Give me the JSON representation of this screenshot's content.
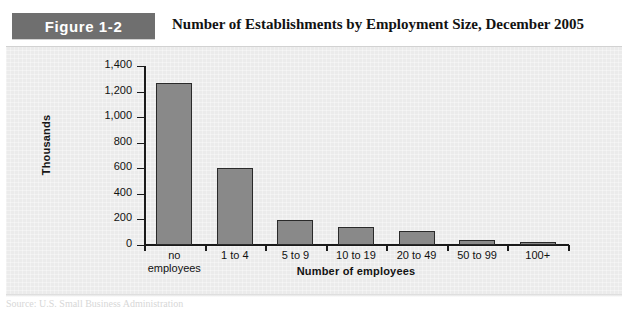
{
  "header": {
    "badge_label": "Figure 1-2",
    "title": "Number of Establishments by Employment Size, December 2005",
    "badge_color": "#6f6f6f",
    "title_color": "#121212"
  },
  "panel": {
    "background_color": "#ebebeb"
  },
  "footer": {
    "source_text": "Source: U.S. Small Business Administration"
  },
  "chart_data": {
    "type": "bar",
    "title": "Number of Establishments by Employment Size, December 2005",
    "xlabel": "Number of employees",
    "ylabel": "Thousands",
    "categories": [
      "no\nemployees",
      "1 to 4",
      "5 to 9",
      "10 to 19",
      "20 to 49",
      "50 to 99",
      "100+"
    ],
    "values": [
      1270,
      605,
      195,
      140,
      110,
      40,
      20
    ],
    "ylim": [
      0,
      1400
    ],
    "yticks": [
      0,
      200,
      400,
      600,
      800,
      1000,
      1200,
      1400
    ],
    "ytick_labels": [
      "0",
      "200",
      "400",
      "600",
      "800",
      "1,000",
      "1,200",
      "1,400"
    ],
    "grid": false,
    "legend": false,
    "bar_color": "#898989",
    "bar_edge_color": "#2a2a2a"
  }
}
